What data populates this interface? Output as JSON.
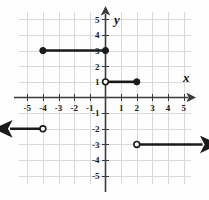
{
  "figure": {
    "title": "",
    "axis_labels": {
      "x": "x",
      "y": "y"
    },
    "background_color": "#fefefe",
    "grid_color": "#d9d9d9",
    "axis_color": "#3a3a3a",
    "plot_color": "#1a1a1a"
  },
  "chart_data": {
    "type": "line",
    "title": "",
    "xlabel": "x",
    "ylabel": "y",
    "xlim": [
      -5.8,
      5.8
    ],
    "ylim": [
      -5.8,
      5.8
    ],
    "grid": true,
    "legend": "none",
    "x_ticks": [
      -5,
      -4,
      -3,
      -2,
      -1,
      1,
      2,
      3,
      4,
      5
    ],
    "y_ticks": [
      -5,
      -4,
      -3,
      -2,
      -1,
      1,
      2,
      3,
      4,
      5
    ],
    "x_tick_labels": [
      "-5",
      "-4",
      "-3",
      "-2",
      "-1",
      "1",
      "2",
      "3",
      "4",
      "5"
    ],
    "y_tick_labels": [
      "-5",
      "-4",
      "-3",
      "-2",
      "-1",
      "1",
      "2",
      "3",
      "4",
      "5"
    ],
    "series": [
      {
        "name": "segment-y3",
        "kind": "segment",
        "y": 3,
        "x_start": -4,
        "x_end": 0,
        "start_endpoint": "closed",
        "end_endpoint": "closed",
        "arrow_start": false,
        "arrow_end": false
      },
      {
        "name": "segment-y1",
        "kind": "segment",
        "y": 1,
        "x_start": 0,
        "x_end": 2,
        "start_endpoint": "open",
        "end_endpoint": "closed",
        "arrow_start": false,
        "arrow_end": false
      },
      {
        "name": "ray-left-y-neg2",
        "kind": "ray",
        "y": -2,
        "x_start": -4,
        "x_end": -6.1,
        "start_endpoint": "open",
        "end_endpoint": "arrow",
        "arrow_start": false,
        "arrow_end": true,
        "direction": "left"
      },
      {
        "name": "ray-right-y-neg3",
        "kind": "ray",
        "y": -3,
        "x_start": 2,
        "x_end": 6.2,
        "start_endpoint": "open",
        "end_endpoint": "arrow",
        "arrow_start": false,
        "arrow_end": true,
        "direction": "right"
      }
    ],
    "points": [
      {
        "x": -4,
        "y": 3,
        "style": "closed"
      },
      {
        "x": 0,
        "y": 3,
        "style": "closed"
      },
      {
        "x": 0,
        "y": 1,
        "style": "open"
      },
      {
        "x": 2,
        "y": 1,
        "style": "closed"
      },
      {
        "x": -4,
        "y": -2,
        "style": "open"
      },
      {
        "x": 2,
        "y": -3,
        "style": "open"
      }
    ]
  }
}
